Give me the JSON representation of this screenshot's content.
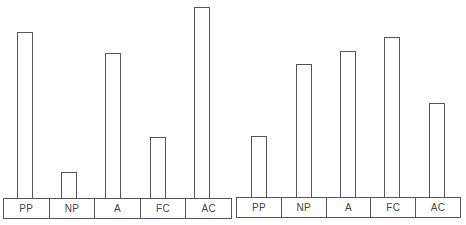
{
  "chart_data": [
    {
      "type": "bar",
      "title": "",
      "xlabel": "",
      "ylabel": "",
      "grid": false,
      "legend": null,
      "value_unit": "relative bar height (px, no axis shown)",
      "categories": [
        "PP",
        "NP",
        "A",
        "FC",
        "AC"
      ],
      "values": [
        166,
        26,
        145,
        61,
        191
      ]
    },
    {
      "type": "bar",
      "title": "",
      "xlabel": "",
      "ylabel": "",
      "grid": false,
      "legend": null,
      "value_unit": "relative bar height (px, no axis shown)",
      "categories": [
        "PP",
        "NP",
        "A",
        "FC",
        "AC"
      ],
      "values": [
        61,
        133,
        146,
        160,
        94
      ]
    }
  ],
  "panels": [
    {
      "base": {
        "left": 3,
        "top": 198,
        "width": 229
      },
      "bar_x": [
        17,
        61,
        105,
        150,
        194
      ],
      "labels": [
        "PP",
        "NP",
        "A",
        "FC",
        "AC"
      ]
    },
    {
      "base": {
        "left": 236,
        "top": 197,
        "width": 225
      },
      "bar_x": [
        251,
        296,
        340,
        384,
        429
      ],
      "labels": [
        "PP",
        "NP",
        "A",
        "FC",
        "AC"
      ]
    }
  ],
  "colors": {
    "stroke": "#555555",
    "text": "#444444",
    "background": "#ffffff"
  }
}
